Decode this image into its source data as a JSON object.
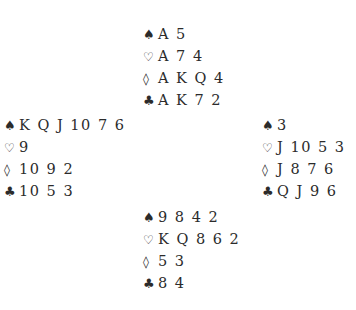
{
  "suit_symbols": {
    "spades": "♠",
    "hearts": "♡",
    "diamonds": "◊",
    "clubs": "♣"
  },
  "hands": {
    "north": {
      "spades": "A 5",
      "hearts": "A 7 4",
      "diamonds": "A K Q 4",
      "clubs": "A K 7 2"
    },
    "west": {
      "spades": "K Q J 10 7 6",
      "hearts": "9",
      "diamonds": "10 9 2",
      "clubs": "10 5 3"
    },
    "east": {
      "spades": "3",
      "hearts": "J 10 5 3",
      "diamonds": "J 8 7 6",
      "clubs": "Q J 9 6"
    },
    "south": {
      "spades": "9 8 4 2",
      "hearts": "K Q 8 6 2",
      "diamonds": "5 3",
      "clubs": "8 4"
    }
  }
}
